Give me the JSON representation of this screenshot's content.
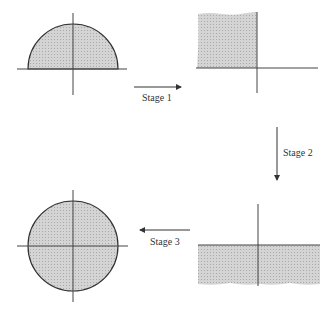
{
  "diagram": {
    "stages": [
      {
        "label": "Stage 1",
        "direction": "right"
      },
      {
        "label": "Stage 2",
        "direction": "down"
      },
      {
        "label": "Stage 3",
        "direction": "left"
      }
    ],
    "panels": [
      {
        "name": "upper-half-disk",
        "position": "top-left"
      },
      {
        "name": "second-quadrant-region",
        "position": "top-right"
      },
      {
        "name": "lower-half-plane",
        "position": "bottom-right"
      },
      {
        "name": "unit-disk",
        "position": "bottom-left"
      }
    ],
    "colors": {
      "fill": "#c8c8c8",
      "line": "#333333",
      "axis": "#444444"
    }
  }
}
